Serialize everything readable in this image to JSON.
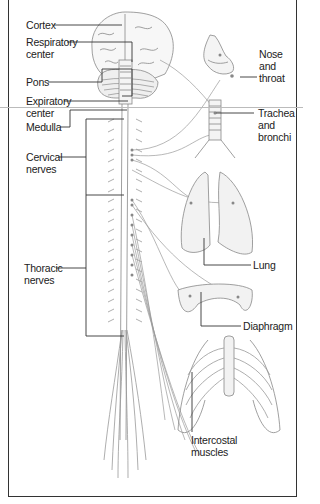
{
  "diagram": {
    "labels_left": [
      {
        "id": "cortex",
        "text": "Cortex"
      },
      {
        "id": "respiratory-center",
        "line1": "Respiratory",
        "line2": "center"
      },
      {
        "id": "pons",
        "text": "Pons"
      },
      {
        "id": "expiratory-center",
        "line1": "Expiratory",
        "line2": "center"
      },
      {
        "id": "medulla",
        "text": "Medulla"
      },
      {
        "id": "cervical-nerves",
        "line1": "Cervical",
        "line2": "nerves"
      },
      {
        "id": "thoracic-nerves",
        "line1": "Thoracic",
        "line2": "nerves"
      }
    ],
    "labels_right": [
      {
        "id": "nose-throat",
        "line1": "Nose",
        "line2": "and",
        "line3": "throat"
      },
      {
        "id": "trachea-bronchi",
        "line1": "Trachea",
        "line2": "and",
        "line3": "bronchi"
      },
      {
        "id": "lung",
        "text": "Lung"
      },
      {
        "id": "diaphragm",
        "text": "Diaphragm"
      }
    ],
    "labels_bottom": [
      {
        "id": "intercostal-muscles",
        "line1": "Intercostal",
        "line2": "muscles"
      }
    ],
    "colors": {
      "line": "#333333",
      "drawing": "#777777",
      "fill": "#f2f2f2",
      "border": "#333333"
    }
  }
}
